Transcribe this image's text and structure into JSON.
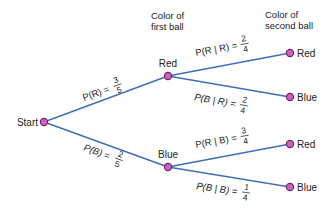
{
  "headers": {
    "first_ball": [
      "Color of",
      "first ball"
    ],
    "second_ball": [
      "Color of",
      "second ball"
    ]
  },
  "nodes": {
    "start": "Start",
    "first_red": "Red",
    "first_blue": "Blue",
    "second_red_after_red": "Red",
    "second_blue_after_red": "Blue",
    "second_red_after_blue": "Red",
    "second_blue_after_blue": "Blue"
  },
  "edges": {
    "start_to_red": {
      "label": "P(R) =",
      "num": "3",
      "den": "5"
    },
    "start_to_blue": {
      "label": "P(B) =",
      "num": "2",
      "den": "5"
    },
    "red_to_red": {
      "label": "P(R | R) =",
      "num": "2",
      "den": "4"
    },
    "red_to_blue": {
      "label": "P(B | R) =",
      "num": "2",
      "den": "4"
    },
    "blue_to_red": {
      "label": "P(R | B) =",
      "num": "3",
      "den": "4"
    },
    "blue_to_blue": {
      "label": "P(B | B) =",
      "num": "1",
      "den": "4"
    }
  },
  "colors": {
    "edge": "#3f6fb5",
    "node_fill": "#d45fc0",
    "node_stroke": "#6a2a66"
  }
}
